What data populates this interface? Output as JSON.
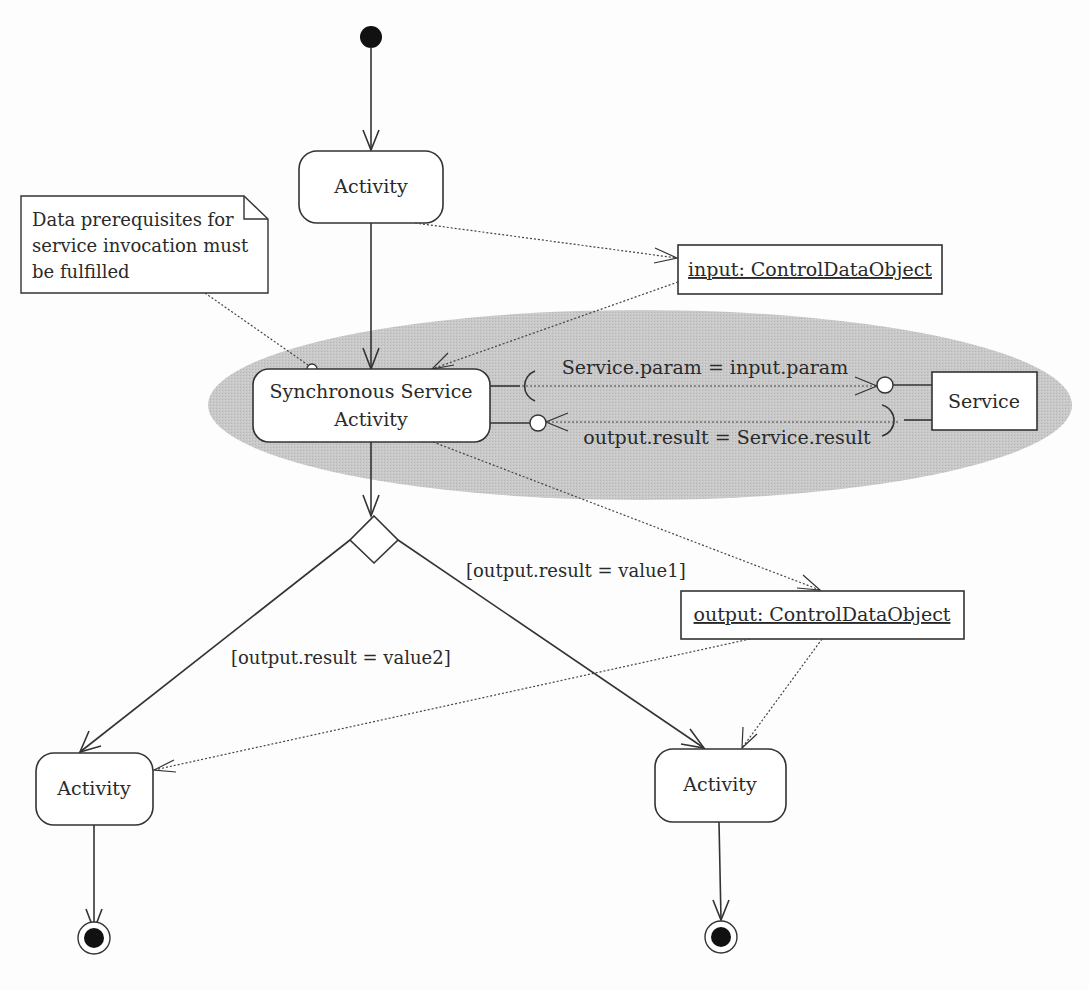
{
  "diagram": {
    "type": "UML activity diagram",
    "colors": {
      "background": "#fdfdfd",
      "line": "#333333",
      "region_fill": "#c8c8c8",
      "node_fill": "#ffffff"
    },
    "nodes": {
      "initial": {
        "kind": "initial-node"
      },
      "activity_top": {
        "label": "Activity"
      },
      "sync_activity": {
        "label_line1": "Synchronous Service",
        "label_line2": "Activity"
      },
      "service": {
        "label": "Service"
      },
      "input_object": {
        "label": "input: ControlDataObject"
      },
      "output_object": {
        "label": "output: ControlDataObject"
      },
      "decision": {
        "kind": "decision-node"
      },
      "activity_left": {
        "label": "Activity"
      },
      "activity_right": {
        "label": "Activity"
      },
      "final_left": {
        "kind": "final-node"
      },
      "final_right": {
        "kind": "final-node"
      }
    },
    "note": {
      "line1": "Data prerequisites for",
      "line2": "service invocation must",
      "line3": "be fulfilled"
    },
    "interface_flows": {
      "request": "Service.param = input.param",
      "response": "output.result = Service.result"
    },
    "guards": {
      "value1": "[output.result = value1]",
      "value2": "[output.result = value2]"
    }
  }
}
